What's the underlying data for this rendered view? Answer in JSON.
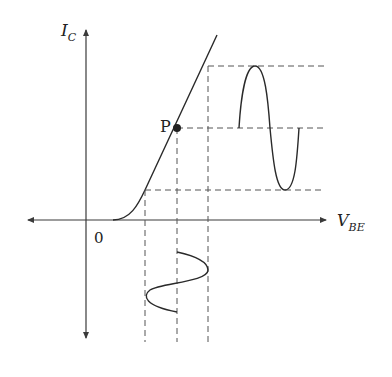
{
  "diagram": {
    "labels": {
      "y_axis": "I",
      "y_axis_sub": "C",
      "x_axis": "V",
      "x_axis_sub": "BE",
      "origin": "0",
      "point": "P"
    },
    "colors": {
      "line": "#2a2a2a",
      "axis": "#3a3a3a",
      "dash": "#555555",
      "background": "#ffffff"
    },
    "elements": [
      "y-axis with arrow (I_C), extends downward with arrow",
      "x-axis with arrows both ends (V_BE)",
      "characteristic curve: flat then knee then linear rise",
      "operating point P (filled dot)",
      "output sine wave (I_C) on right, projected via horizontal dashed lines",
      "input sine wave (V_BE) below x-axis, projected via vertical dashed lines"
    ]
  }
}
